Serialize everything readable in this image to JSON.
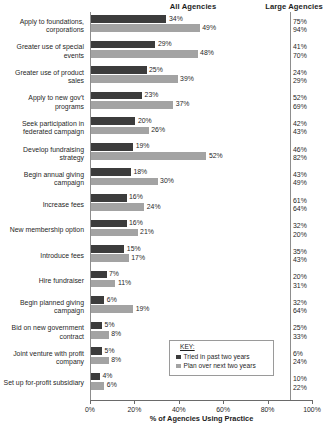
{
  "header": {
    "all_agencies": "All Agencies",
    "large_agencies": "Large Agencies"
  },
  "legend": {
    "title": "KEY:",
    "items": [
      {
        "label": "Tried in past two years",
        "color": "#3c3c3c"
      },
      {
        "label": "Plan over next two years",
        "color": "#a3a3a3"
      }
    ]
  },
  "axis": {
    "xlabel": "% of Agencies Using Practice",
    "ticks": [
      "0%",
      "20%",
      "40%",
      "60%",
      "80%",
      "100%"
    ]
  },
  "chart_data": {
    "type": "bar",
    "orientation": "horizontal",
    "title": "",
    "xlabel": "% of Agencies Using Practice",
    "ylabel": "",
    "xlim": [
      0,
      100
    ],
    "grid": false,
    "legend_position": "inside-bottom-center",
    "categories": [
      "Apply to foundations, corporations",
      "Greater use of special events",
      "Greater use of product sales",
      "Apply to new gov't programs",
      "Seek participation in federated campaign",
      "Develop fundraising strategy",
      "Begin annual giving campaign",
      "Increase fees",
      "New membership option",
      "Introduce fees",
      "Hire fundraiser",
      "Begin planned giving campaign",
      "Bid on new government contract",
      "Joint venture with profit company",
      "Set up for-profit subsidiary"
    ],
    "series": [
      {
        "name": "Tried in past two years",
        "color": "#3c3c3c",
        "values": [
          34,
          29,
          25,
          23,
          20,
          19,
          18,
          16,
          16,
          15,
          7,
          6,
          5,
          5,
          4
        ],
        "labels": [
          "34%",
          "29%",
          "25%",
          "23%",
          "20%",
          "19%",
          "18%",
          "16%",
          "16%",
          "15%",
          "7%",
          "6%",
          "5%",
          "5%",
          "4%"
        ]
      },
      {
        "name": "Plan over next two years",
        "color": "#a3a3a3",
        "values": [
          49,
          48,
          39,
          37,
          26,
          52,
          30,
          24,
          21,
          17,
          11,
          19,
          8,
          8,
          6
        ],
        "labels": [
          "49%",
          "48%",
          "39%",
          "37%",
          "26%",
          "52%",
          "30%",
          "24%",
          "21%",
          "17%",
          "11%",
          "19%",
          "8%",
          "8%",
          "6%"
        ]
      }
    ],
    "large_agencies": {
      "header": "Large Agencies",
      "tried": [
        "75%",
        "41%",
        "24%",
        "52%",
        "42%",
        "46%",
        "43%",
        "61%",
        "32%",
        "35%",
        "20%",
        "32%",
        "25%",
        "6%",
        "10%"
      ],
      "plan": [
        "94%",
        "70%",
        "29%",
        "69%",
        "43%",
        "82%",
        "49%",
        "64%",
        "20%",
        "43%",
        "31%",
        "64%",
        "33%",
        "24%",
        "22%"
      ]
    }
  },
  "rows": [
    {
      "label": "Apply to foundations, corporations",
      "tried": 34,
      "plan": 49,
      "tried_label": "34%",
      "plan_label": "49%",
      "large_tried": "75%",
      "large_plan": "94%"
    },
    {
      "label": "Greater use of special events",
      "tried": 29,
      "plan": 48,
      "tried_label": "29%",
      "plan_label": "48%",
      "large_tried": "41%",
      "large_plan": "70%"
    },
    {
      "label": "Greater use of product sales",
      "tried": 25,
      "plan": 39,
      "tried_label": "25%",
      "plan_label": "39%",
      "large_tried": "24%",
      "large_plan": "29%"
    },
    {
      "label": "Apply to new gov't programs",
      "tried": 23,
      "plan": 37,
      "tried_label": "23%",
      "plan_label": "37%",
      "large_tried": "52%",
      "large_plan": "69%"
    },
    {
      "label": "Seek participation in federated campaign",
      "tried": 20,
      "plan": 26,
      "tried_label": "20%",
      "plan_label": "26%",
      "large_tried": "42%",
      "large_plan": "43%"
    },
    {
      "label": "Develop fundraising strategy",
      "tried": 19,
      "plan": 52,
      "tried_label": "19%",
      "plan_label": "52%",
      "large_tried": "46%",
      "large_plan": "82%"
    },
    {
      "label": "Begin annual giving campaign",
      "tried": 18,
      "plan": 30,
      "tried_label": "18%",
      "plan_label": "30%",
      "large_tried": "43%",
      "large_plan": "49%"
    },
    {
      "label": "Increase fees",
      "tried": 16,
      "plan": 24,
      "tried_label": "16%",
      "plan_label": "24%",
      "large_tried": "61%",
      "large_plan": "64%"
    },
    {
      "label": "New membership option",
      "tried": 16,
      "plan": 21,
      "tried_label": "16%",
      "plan_label": "21%",
      "large_tried": "32%",
      "large_plan": "20%"
    },
    {
      "label": "Introduce fees",
      "tried": 15,
      "plan": 17,
      "tried_label": "15%",
      "plan_label": "17%",
      "large_tried": "35%",
      "large_plan": "43%"
    },
    {
      "label": "Hire fundraiser",
      "tried": 7,
      "plan": 11,
      "tried_label": "7%",
      "plan_label": "11%",
      "large_tried": "20%",
      "large_plan": "31%"
    },
    {
      "label": "Begin planned giving campaign",
      "tried": 6,
      "plan": 19,
      "tried_label": "6%",
      "plan_label": "19%",
      "large_tried": "32%",
      "large_plan": "64%"
    },
    {
      "label": "Bid on new government contract",
      "tried": 5,
      "plan": 8,
      "tried_label": "5%",
      "plan_label": "8%",
      "large_tried": "25%",
      "large_plan": "33%"
    },
    {
      "label": "Joint venture with profit company",
      "tried": 5,
      "plan": 8,
      "tried_label": "5%",
      "plan_label": "8%",
      "large_tried": "6%",
      "large_plan": "24%"
    },
    {
      "label": "Set up for-profit subsidiary",
      "tried": 4,
      "plan": 6,
      "tried_label": "4%",
      "plan_label": "6%",
      "large_tried": "10%",
      "large_plan": "22%"
    }
  ]
}
